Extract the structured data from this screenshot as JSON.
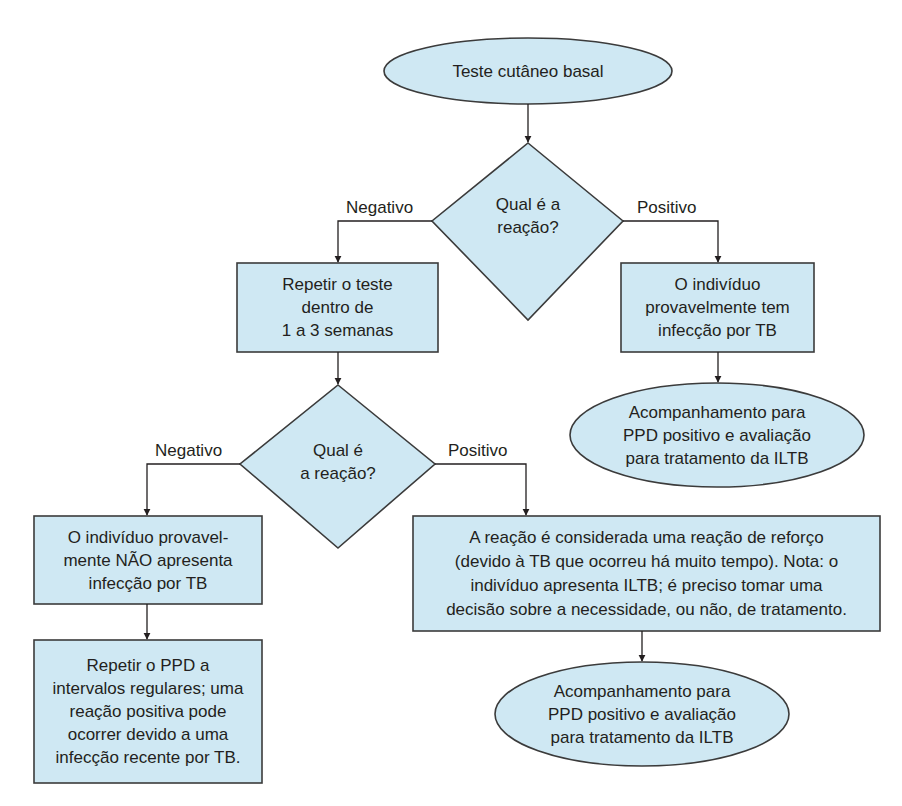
{
  "colors": {
    "fill": "#cfe8f3",
    "stroke": "#3b3b3b",
    "text": "#231f20",
    "background": "#ffffff"
  },
  "nodes": {
    "start": {
      "shape": "ellipse",
      "text": "Teste cutâneo basal"
    },
    "decision1": {
      "shape": "diamond",
      "text": "Qual é a\nreação?"
    },
    "repeat_test": {
      "shape": "rectangle",
      "text": "Repetir o teste\ndentro de\n1 a 3 semanas"
    },
    "probably_infected": {
      "shape": "rectangle",
      "text": "O indivíduo\nprovavelmente tem\ninfecção por TB"
    },
    "followup1": {
      "shape": "ellipse",
      "text": "Acompanhamento para\nPPD positivo e avaliação\npara tratamento da ILTB"
    },
    "decision2": {
      "shape": "diamond",
      "text": "Qual é\na reação?"
    },
    "not_infected": {
      "shape": "rectangle",
      "text": "O indivíduo provavel-\nmente NÃO apresenta\ninfecção por TB"
    },
    "repeat_ppd": {
      "shape": "rectangle",
      "text": "Repetir o PPD a\nintervalos regulares; uma\nreação positiva pode\nocorrer devido a uma\ninfecção recente por TB."
    },
    "booster": {
      "shape": "rectangle",
      "text": "A reação é considerada uma reação de reforço\n(devido à TB que ocorreu há muito tempo). Nota: o\nindivíduo apresenta ILTB; é preciso tomar uma\ndecisão sobre a necessidade, ou não, de tratamento."
    },
    "followup2": {
      "shape": "ellipse",
      "text": "Acompanhamento para\nPPD positivo e avaliação\npara tratamento da ILTB"
    }
  },
  "edges": {
    "d1_negative": {
      "from": "decision1",
      "to": "repeat_test",
      "label": "Negativo"
    },
    "d1_positive": {
      "from": "decision1",
      "to": "probably_infected",
      "label": "Positivo"
    },
    "d2_negative": {
      "from": "decision2",
      "to": "not_infected",
      "label": "Negativo"
    },
    "d2_positive": {
      "from": "decision2",
      "to": "booster",
      "label": "Positivo"
    },
    "start_to_d1": {
      "from": "start",
      "to": "decision1",
      "label": ""
    },
    "repeat_to_d2": {
      "from": "repeat_test",
      "to": "decision2",
      "label": ""
    },
    "infected_to_followup1": {
      "from": "probably_infected",
      "to": "followup1",
      "label": ""
    },
    "notinfected_to_repeatppd": {
      "from": "not_infected",
      "to": "repeat_ppd",
      "label": ""
    },
    "booster_to_followup2": {
      "from": "booster",
      "to": "followup2",
      "label": ""
    }
  }
}
